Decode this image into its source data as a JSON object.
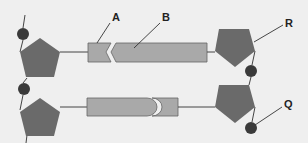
{
  "diagram": {
    "labels": {
      "A": "A",
      "B": "B",
      "R": "R",
      "Q": "Q"
    },
    "colors": {
      "background": "#efefef",
      "sugar": "#6a6a6a",
      "phosphate": "#3a3a3a",
      "base": "#a9a9a9",
      "base_outline": "#555555",
      "line": "#444444"
    },
    "components": {
      "sugar_pentagons": 4,
      "phosphate_circles": 4,
      "base_pairs": 2
    }
  }
}
